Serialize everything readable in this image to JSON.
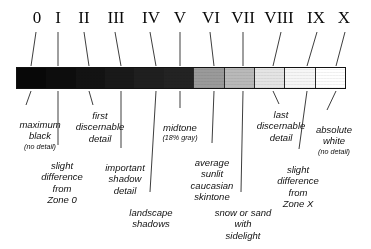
{
  "diagram": {
    "bar": {
      "label": "zone-system-gray-scale-bar",
      "segment_count": 11,
      "segments": [
        {
          "zone": "0",
          "name": "maximum black",
          "hex": "#080808",
          "percent_reflectance": 0
        },
        {
          "zone": "I",
          "name": "near black",
          "hex": "#0d0d0d",
          "percent_reflectance": 2
        },
        {
          "zone": "II",
          "name": "first detail",
          "hex": "#131313",
          "percent_reflectance": 4
        },
        {
          "zone": "III",
          "name": "shadow detail",
          "hex": "#191919",
          "percent_reflectance": 9
        },
        {
          "zone": "IV",
          "name": "dark midtone",
          "hex": "#1f1f1f",
          "percent_reflectance": 13
        },
        {
          "zone": "V",
          "name": "midtone 18% gray",
          "hex": "#232323",
          "percent_reflectance": 18
        },
        {
          "zone": "VI",
          "name": "light midtone",
          "hex": "#9a9a9a",
          "percent_reflectance": 36
        },
        {
          "zone": "VII",
          "name": "light tone",
          "hex": "#b9b9b9",
          "percent_reflectance": 54
        },
        {
          "zone": "VIII",
          "name": "highlight detail",
          "hex": "#e4e4e4",
          "percent_reflectance": 72
        },
        {
          "zone": "IX",
          "name": "near white",
          "hex": "#f6f6f6",
          "percent_reflectance": 90
        },
        {
          "zone": "X",
          "name": "absolute white",
          "hex": "#ffffff",
          "percent_reflectance": 100
        }
      ]
    },
    "numerals": [
      {
        "id": "zone-0",
        "label": "0"
      },
      {
        "id": "zone-1",
        "label": "I"
      },
      {
        "id": "zone-2",
        "label": "II"
      },
      {
        "id": "zone-3",
        "label": "III"
      },
      {
        "id": "zone-4",
        "label": "IV"
      },
      {
        "id": "zone-5",
        "label": "V"
      },
      {
        "id": "zone-6",
        "label": "VI"
      },
      {
        "id": "zone-7",
        "label": "VII"
      },
      {
        "id": "zone-8",
        "label": "VIII"
      },
      {
        "id": "zone-9",
        "label": "IX"
      },
      {
        "id": "zone-10",
        "label": "X"
      }
    ],
    "captions": [
      {
        "id": "maximum-black",
        "main": "maximum\nblack",
        "sub": "(no detail)"
      },
      {
        "id": "slight-difference-zone0",
        "main": "slight\ndifference\nfrom\nZone 0",
        "sub": ""
      },
      {
        "id": "first-discernable",
        "main": "first\ndiscernable\ndetail",
        "sub": ""
      },
      {
        "id": "important-shadow",
        "main": "important\nshadow\ndetail",
        "sub": ""
      },
      {
        "id": "landscape-shadows",
        "main": "landscape\nshadows",
        "sub": ""
      },
      {
        "id": "midtone",
        "main": "midtone",
        "sub": "(18% gray)"
      },
      {
        "id": "average-skintone",
        "main": "average\nsunlit\ncaucasian\nskintone",
        "sub": ""
      },
      {
        "id": "snow-or-sand",
        "main": "snow or sand\nwith\nsidelight",
        "sub": ""
      },
      {
        "id": "last-discernable",
        "main": "last\ndiscernable\ndetail",
        "sub": ""
      },
      {
        "id": "slight-difference-zonex",
        "main": "slight\ndifference\nfrom\nZone X",
        "sub": ""
      },
      {
        "id": "absolute-white",
        "main": "absolute\nwhite",
        "sub": "(no detail)"
      }
    ]
  }
}
